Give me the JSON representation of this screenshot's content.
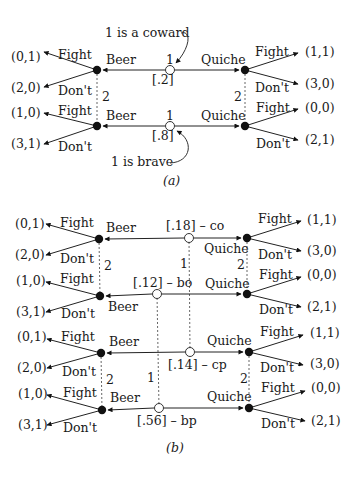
{
  "panel_a": {
    "caption": "(a)",
    "nature_player": "1",
    "receiver_player": "2",
    "types": [
      {
        "id": "coward",
        "prob": "[.2]",
        "annotation": "1 is a coward",
        "beer": {
          "move": "Beer",
          "fight": "Fight",
          "dont": "Don't",
          "fight_payoff": "(0,1)",
          "dont_payoff": "(2,0)"
        },
        "quiche": {
          "move": "Quiche",
          "fight": "Fight",
          "dont": "Don't",
          "fight_payoff": "(1,1)",
          "dont_payoff": "(3,0)"
        }
      },
      {
        "id": "brave",
        "prob": "[.8]",
        "annotation": "1 is brave",
        "beer": {
          "move": "Beer",
          "fight": "Fight",
          "dont": "Don't",
          "fight_payoff": "(1,0)",
          "dont_payoff": "(3,1)"
        },
        "quiche": {
          "move": "Quiche",
          "fight": "Fight",
          "dont": "Don't",
          "fight_payoff": "(0,0)",
          "dont_payoff": "(2,1)"
        }
      }
    ]
  },
  "panel_b": {
    "caption": "(b)",
    "nature_player": "1",
    "receiver_player": "2",
    "types": [
      {
        "id": "co",
        "label": "[.18] – co",
        "beer": {
          "move": "Beer",
          "fight": "Fight",
          "dont": "Don't",
          "fight_payoff": "(0,1)",
          "dont_payoff": "(2,0)"
        },
        "quiche": {
          "move": "Quiche",
          "fight": "Fight",
          "dont": "Don't",
          "fight_payoff": "(1,1)",
          "dont_payoff": "(3,0)"
        }
      },
      {
        "id": "bo",
        "label": "[.12] – bo",
        "beer": {
          "move": "Beer",
          "fight": "Fight",
          "dont": "Don't",
          "fight_payoff": "(1,0)",
          "dont_payoff": "(3,1)"
        },
        "quiche": {
          "move": "Quiche",
          "fight": "Fight",
          "dont": "Don't",
          "fight_payoff": "(0,0)",
          "dont_payoff": "(2,1)"
        }
      },
      {
        "id": "cp",
        "label": "[.14] – cp",
        "beer": {
          "move": "Beer",
          "fight": "Fight",
          "dont": "Don't",
          "fight_payoff": "(0,1)",
          "dont_payoff": "(2,0)"
        },
        "quiche": {
          "move": "Quiche",
          "fight": "Fight",
          "dont": "Don't",
          "fight_payoff": "(1,1)",
          "dont_payoff": "(3,0)"
        }
      },
      {
        "id": "bp",
        "label": "[.56] – bp",
        "beer": {
          "move": "Beer",
          "fight": "Fight",
          "dont": "Don't",
          "fight_payoff": "(1,0)",
          "dont_payoff": "(3,1)"
        },
        "quiche": {
          "move": "Quiche",
          "fight": "Fight",
          "dont": "Don't",
          "fight_payoff": "(0,0)",
          "dont_payoff": "(2,1)"
        }
      }
    ]
  }
}
